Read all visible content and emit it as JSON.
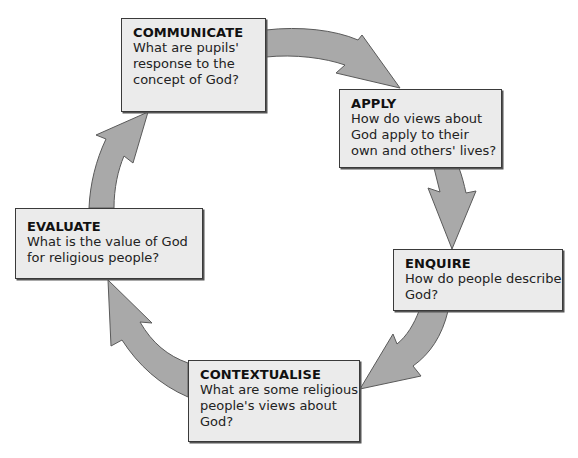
{
  "diagram": {
    "type": "cycle",
    "stages": [
      {
        "id": "communicate",
        "title": "COMMUNICATE",
        "question": "What are pupils'\nresponse to the\nconcept of God?"
      },
      {
        "id": "apply",
        "title": "APPLY",
        "question": "How do views about\nGod apply to their\nown and others' lives?"
      },
      {
        "id": "enquire",
        "title": "ENQUIRE",
        "question": "How do people describe\nGod?"
      },
      {
        "id": "contextualise",
        "title": "CONTEXTUALISE",
        "question": "What are some religious\npeople's views about\nGod?"
      },
      {
        "id": "evaluate",
        "title": "EVALUATE",
        "question": "What is the value of God\nfor religious people?"
      }
    ],
    "flow": [
      {
        "from": "communicate",
        "to": "apply"
      },
      {
        "from": "apply",
        "to": "enquire"
      },
      {
        "from": "enquire",
        "to": "contextualise"
      },
      {
        "from": "contextualise",
        "to": "evaluate"
      },
      {
        "from": "evaluate",
        "to": "communicate"
      }
    ],
    "colors": {
      "box_fill": "#ebebeb",
      "box_border": "#3a3a3a",
      "arrow_fill": "#a9a9a9",
      "arrow_stroke": "#5a5a5a"
    }
  }
}
